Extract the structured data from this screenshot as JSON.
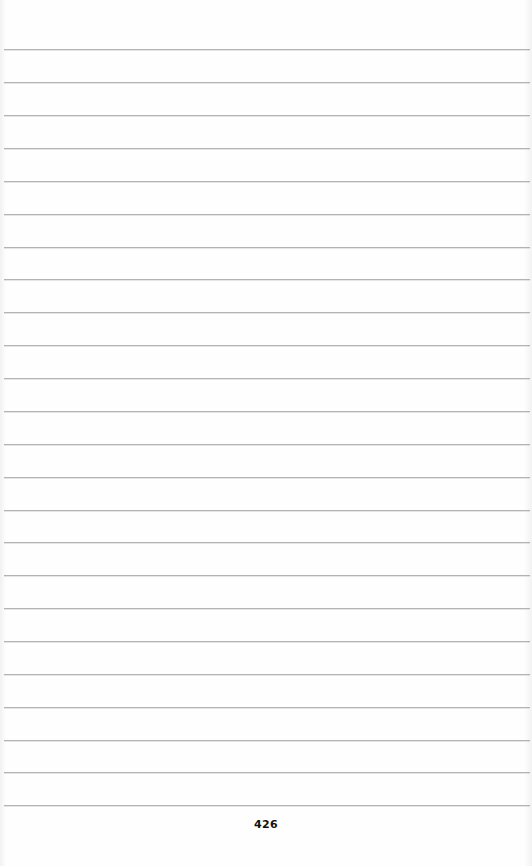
{
  "page": {
    "type": "lined-notebook-page",
    "background_color": "#fefefe",
    "rule_color": "#b3b3b3",
    "rule_count": 24,
    "rule_positions_y": [
      49,
      82,
      115,
      148,
      181,
      214,
      247,
      279,
      312,
      345,
      378,
      411,
      444,
      477,
      510,
      542,
      575,
      608,
      641,
      674,
      707,
      740,
      772,
      805
    ],
    "page_number": "426"
  }
}
